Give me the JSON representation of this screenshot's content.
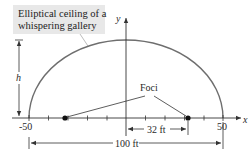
{
  "diagram": {
    "callout": {
      "line1": "Elliptical ceiling of a",
      "line2": "whispering gallery"
    },
    "axes": {
      "x_label": "x",
      "y_label": "y",
      "x_min_label": "-50",
      "x_max_label": "50",
      "tick_interval": 10
    },
    "height_label": "h",
    "foci_label": "Foci",
    "focus_distance_label": "32 ft",
    "width_label": "100 ft",
    "colors": {
      "ellipse": "#6e6e6e",
      "axes": "#333333",
      "callout_fill": "#e8e8e8",
      "focus_point": "#111111"
    },
    "ellipse": {
      "semi_major": 50,
      "foci_x": [
        -32,
        32
      ]
    }
  }
}
